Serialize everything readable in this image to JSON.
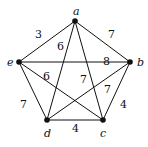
{
  "graph": {
    "vertices": [
      {
        "id": "a",
        "label": "a",
        "x": 75,
        "y": 21,
        "lx": 73,
        "ly": 15
      },
      {
        "id": "b",
        "label": "b",
        "x": 130,
        "y": 62,
        "lx": 137,
        "ly": 66
      },
      {
        "id": "c",
        "label": "c",
        "x": 103,
        "y": 120,
        "lx": 100,
        "ly": 137
      },
      {
        "id": "d",
        "label": "d",
        "x": 47,
        "y": 120,
        "lx": 44,
        "ly": 137
      },
      {
        "id": "e",
        "label": "e",
        "x": 19,
        "y": 62,
        "lx": 7,
        "ly": 66
      }
    ],
    "edges": [
      {
        "from": "a",
        "to": "e",
        "weight": "3",
        "lx": 35,
        "ly": 38
      },
      {
        "from": "a",
        "to": "b",
        "weight": "7",
        "lx": 108,
        "ly": 38
      },
      {
        "from": "a",
        "to": "d",
        "weight": "6",
        "lx": 57,
        "ly": 50
      },
      {
        "from": "a",
        "to": "c",
        "weight": "7",
        "lx": 80,
        "ly": 83
      },
      {
        "from": "e",
        "to": "b",
        "weight": "8",
        "lx": 103,
        "ly": 65
      },
      {
        "from": "e",
        "to": "c",
        "weight": "6",
        "lx": 43,
        "ly": 80
      },
      {
        "from": "e",
        "to": "d",
        "weight": "7",
        "lx": 20,
        "ly": 108
      },
      {
        "from": "b",
        "to": "d",
        "weight": "7",
        "lx": 104,
        "ly": 93
      },
      {
        "from": "b",
        "to": "c",
        "weight": "4",
        "lx": 120,
        "ly": 108
      },
      {
        "from": "d",
        "to": "c",
        "weight": "4",
        "lx": 72,
        "ly": 132
      }
    ]
  }
}
